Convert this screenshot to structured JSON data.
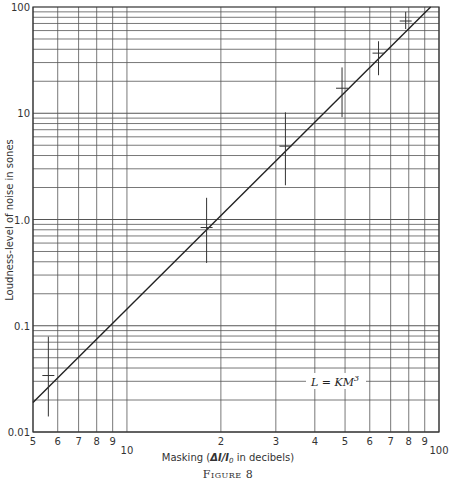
{
  "chart_data": {
    "type": "scatter",
    "title": "",
    "caption": "Figure 8",
    "xlabel": "Masking (ΔI/I₀ in decibels)",
    "ylabel": "Loudness-level of noise in sones",
    "xscale": "log",
    "yscale": "log",
    "xlim": [
      5,
      100
    ],
    "ylim": [
      0.01,
      100
    ],
    "grid": true,
    "x_tick_labels": [
      "5",
      "6",
      "7",
      "8",
      "9",
      "10",
      "2",
      "3",
      "4",
      "5",
      "6",
      "7",
      "8",
      "9",
      "100"
    ],
    "x_tick_values": [
      5,
      6,
      7,
      8,
      9,
      10,
      20,
      30,
      40,
      50,
      60,
      70,
      80,
      90,
      100
    ],
    "y_tick_labels": [
      "0.01",
      "0.1",
      "1.0",
      "10",
      "100"
    ],
    "y_tick_values": [
      0.01,
      0.1,
      1,
      10,
      100
    ],
    "annotation": "L = KM³",
    "series": [
      {
        "name": "Measured loudness",
        "marker": "cross with vertical error bar",
        "points": [
          {
            "x": 5.6,
            "y": 0.034,
            "y_low": 0.014,
            "y_high": 0.079
          },
          {
            "x": 18.0,
            "y": 0.84,
            "y_low": 0.39,
            "y_high": 1.6
          },
          {
            "x": 32.2,
            "y": 4.9,
            "y_low": 2.1,
            "y_high": 10.2
          },
          {
            "x": 48.9,
            "y": 17.2,
            "y_low": 9.2,
            "y_high": 27
          },
          {
            "x": 64.0,
            "y": 36.8,
            "y_low": 22.8,
            "y_high": 47.6
          },
          {
            "x": 78.2,
            "y": 73.8,
            "y_low": 62,
            "y_high": 90
          }
        ]
      },
      {
        "name": "Fit L = KM^3",
        "type": "line",
        "x": [
          5,
          94
        ],
        "y": [
          0.019,
          100
        ]
      }
    ]
  },
  "labels": {
    "xlabel_prefix": "Masking (",
    "xlabel_delta": "ΔI/I",
    "xlabel_sub": "0",
    "xlabel_suffix": " in decibels)",
    "ylabel": "Loudness-level of noise in sones",
    "caption": "Figure 8",
    "formula_lhs": "L = KM",
    "formula_exp": "3"
  }
}
